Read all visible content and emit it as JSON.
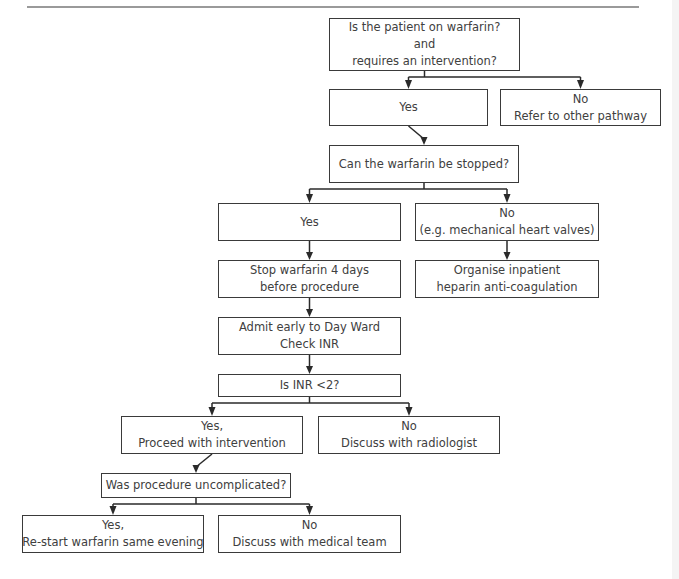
{
  "flowchart": {
    "nodes": {
      "start": {
        "lines": [
          "Is the patient on warfarin?",
          "and",
          "requires an intervention?"
        ]
      },
      "yes1": {
        "lines": [
          "Yes"
        ]
      },
      "no1": {
        "lines": [
          "No",
          "Refer to other pathway"
        ]
      },
      "can_stop": {
        "lines": [
          "Can the warfarin be stopped?"
        ]
      },
      "yes2": {
        "lines": [
          "Yes"
        ]
      },
      "no2": {
        "lines": [
          "No",
          "(e.g. mechanical heart valves)"
        ]
      },
      "stop": {
        "lines": [
          "Stop warfarin 4 days",
          "before procedure"
        ]
      },
      "organise": {
        "lines": [
          "Organise inpatient",
          "heparin anti-coagulation"
        ]
      },
      "admit": {
        "lines": [
          "Admit early to Day Ward",
          "Check INR"
        ]
      },
      "inr": {
        "lines": [
          "Is INR <2?"
        ]
      },
      "yes3": {
        "lines": [
          "Yes,",
          "Proceed with intervention"
        ]
      },
      "no3": {
        "lines": [
          "No",
          "Discuss with radiologist"
        ]
      },
      "was": {
        "lines": [
          "Was procedure uncomplicated?"
        ]
      },
      "yes4": {
        "lines": [
          "Yes,",
          "Re-start warfarin same evening"
        ]
      },
      "no4": {
        "lines": [
          "No",
          "Discuss with medical team"
        ]
      }
    },
    "edges": [
      [
        "start",
        "yes1"
      ],
      [
        "start",
        "no1"
      ],
      [
        "yes1",
        "can_stop"
      ],
      [
        "can_stop",
        "yes2"
      ],
      [
        "can_stop",
        "no2"
      ],
      [
        "yes2",
        "stop"
      ],
      [
        "no2",
        "organise"
      ],
      [
        "stop",
        "admit"
      ],
      [
        "admit",
        "inr"
      ],
      [
        "inr",
        "yes3"
      ],
      [
        "inr",
        "no3"
      ],
      [
        "yes3",
        "was"
      ],
      [
        "was",
        "yes4"
      ],
      [
        "was",
        "no4"
      ]
    ]
  }
}
